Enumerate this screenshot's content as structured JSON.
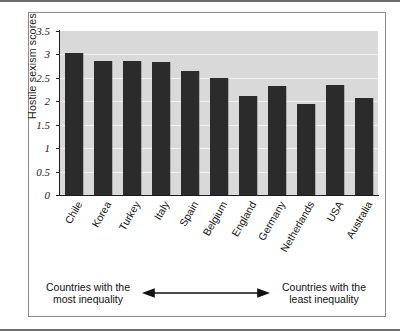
{
  "chart_data": {
    "type": "bar",
    "title": "",
    "xlabel": "",
    "ylabel": "Hostile sexism scores",
    "ylim": [
      0,
      3.5
    ],
    "yticks": [
      "3.5",
      "3",
      "2.5",
      "2",
      "1.5",
      "1",
      "0.5",
      "0"
    ],
    "ytick_values": [
      3.5,
      3,
      2.5,
      2,
      1.5,
      1,
      0.5,
      0
    ],
    "grid": true,
    "legend": "none",
    "bar_color": "#2b2b2b",
    "plot_background": "#d8d8d8",
    "categories": [
      "Chile",
      "Korea",
      "Turkey",
      "Italy",
      "Spain",
      "Belgium",
      "England",
      "Germany",
      "Netherlands",
      "USA",
      "Australia"
    ],
    "values": [
      3.03,
      2.85,
      2.87,
      2.83,
      2.65,
      2.5,
      2.12,
      2.33,
      1.95,
      2.35,
      2.07
    ]
  },
  "annotation": {
    "left_line1": "Countries with the",
    "left_line2": "most inequality",
    "right_line1": "Countries with the",
    "right_line2": "least inequality",
    "arrow": "double-headed-arrow"
  }
}
